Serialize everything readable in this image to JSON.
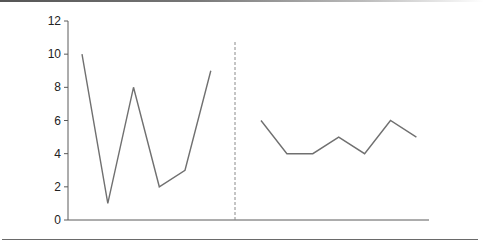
{
  "chart_data": {
    "type": "line",
    "title": "",
    "xlabel": "",
    "ylabel": "",
    "ylim": [
      0,
      12
    ],
    "yticks": [
      0,
      2,
      4,
      6,
      8,
      10,
      12
    ],
    "ytick_labels": [
      "0",
      "2",
      "4",
      "6",
      "8",
      "10",
      "12"
    ],
    "xticks": [],
    "grid": false,
    "legend": null,
    "annotations": [
      "vertical dashed separator between the two series"
    ],
    "series": [
      {
        "name": "left segment",
        "x": [
          1,
          2,
          3,
          4,
          5,
          6
        ],
        "values": [
          10,
          1,
          8,
          2,
          3,
          9
        ]
      },
      {
        "name": "right segment",
        "x": [
          8,
          9,
          10,
          11,
          12,
          13,
          14
        ],
        "values": [
          6,
          4,
          4,
          5,
          4,
          6,
          5
        ]
      }
    ],
    "separator_x": 7,
    "colors": {
      "line": "#707070",
      "axis": "#5a5a5a",
      "separator": "#8a8a8a"
    }
  }
}
